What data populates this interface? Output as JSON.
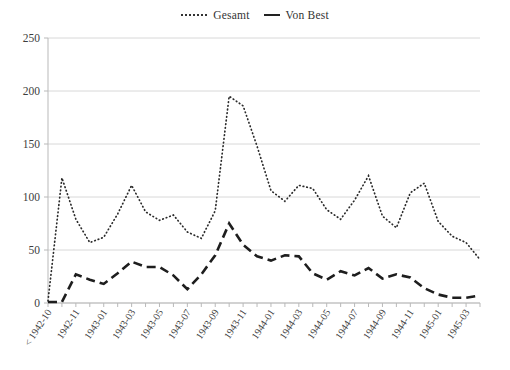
{
  "legend": {
    "position": "top-center",
    "entries": [
      {
        "label": "Gesamt",
        "style": "dotted",
        "color": "#2b2b2b"
      },
      {
        "label": "Von Best",
        "style": "dashed",
        "color": "#1e1e1e"
      }
    ]
  },
  "chart_data": {
    "type": "line",
    "title": "",
    "subtitle": "",
    "xlabel": "",
    "ylabel": "",
    "ylim": [
      0,
      250
    ],
    "yticks": [
      0,
      50,
      100,
      150,
      200,
      250
    ],
    "grid": true,
    "legend_position": "top-center",
    "x": [
      "< 1942-10",
      "1942-11",
      "1942-12",
      "1943-01",
      "1943-02",
      "1943-03",
      "1943-04",
      "1943-05",
      "1943-06",
      "1943-07",
      "1943-08",
      "1943-09",
      "1943-10",
      "1943-11",
      "1943-12",
      "1944-01",
      "1944-02",
      "1944-03",
      "1944-04",
      "1944-05",
      "1944-06",
      "1944-07",
      "1944-08",
      "1944-09",
      "1944-10",
      "1944-11",
      "1944-12",
      "1945-01",
      "1945-02",
      "1945-03",
      "1945-04",
      "1945-05"
    ],
    "xtick_labels": [
      "< 1942-10",
      "1942-11",
      "1943-01",
      "1943-03",
      "1943-05",
      "1943-07",
      "1943-09",
      "1943-11",
      "1944-01",
      "1944-03",
      "1944-05",
      "1944-07",
      "1944-09",
      "1944-11",
      "1945-01",
      "1945-03",
      "1945-05"
    ],
    "xtick_every": 2,
    "series": [
      {
        "name": "Gesamt",
        "style": "dotted",
        "values": [
          2,
          118,
          79,
          57,
          62,
          84,
          111,
          86,
          78,
          83,
          67,
          61,
          87,
          195,
          186,
          148,
          106,
          96,
          111,
          108,
          88,
          79,
          97,
          120,
          82,
          71,
          104,
          113,
          77,
          63,
          57,
          41
        ]
      },
      {
        "name": "Von Best",
        "style": "dashed",
        "values": [
          1,
          1,
          27,
          22,
          18,
          28,
          39,
          34,
          34,
          26,
          13,
          27,
          45,
          75,
          55,
          44,
          40,
          45,
          44,
          28,
          22,
          30,
          26,
          33,
          23,
          27,
          24,
          14,
          8,
          5,
          5,
          7
        ]
      }
    ]
  },
  "plot_geometry": {
    "left": 48,
    "right": 480,
    "top": 38,
    "bottom": 303
  }
}
